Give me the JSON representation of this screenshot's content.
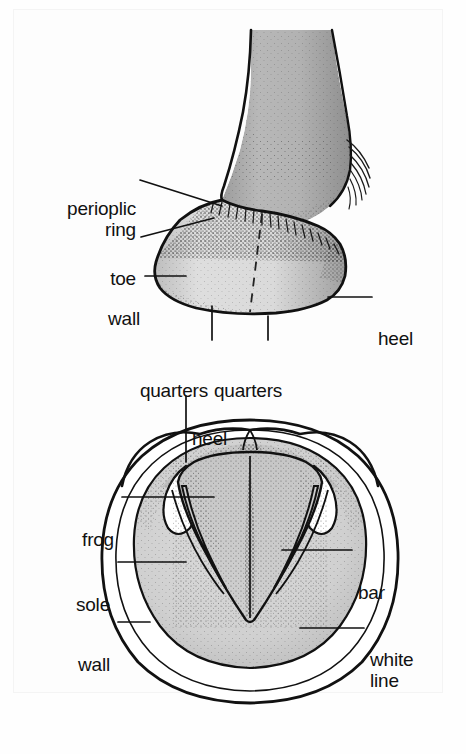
{
  "figure": {
    "background_color": "#fefefe",
    "ink_color": "#111111",
    "panels": [
      {
        "name": "lateral-view",
        "description": "Side view of lower leg, pastern and hoof showing the hoof wall"
      },
      {
        "name": "solar-view",
        "description": "Ground surface (solar) view of the hoof showing sole, frog, bars and white line"
      }
    ],
    "palette": {
      "pastern_gray": "#b2b2b2",
      "wall_gray": "#d8d8d8",
      "sole_gray": "#cfcfcf",
      "frog_gray": "#c8c8c8",
      "white": "#ffffff",
      "outline": "#111111"
    }
  },
  "labels": {
    "lateral": [
      {
        "id": "perioplic-ring",
        "text": "perioplic\nring",
        "align": "right"
      },
      {
        "id": "toe",
        "text": "toe",
        "align": "right"
      },
      {
        "id": "wall",
        "text": "wall",
        "align": "right"
      },
      {
        "id": "quarters-left",
        "text": "quarters",
        "align": "right"
      },
      {
        "id": "quarters-right",
        "text": "quarters",
        "align": "left"
      },
      {
        "id": "heel",
        "text": "heel",
        "align": "left"
      }
    ],
    "solar": [
      {
        "id": "heel",
        "text": "heel",
        "align": "left"
      },
      {
        "id": "frog",
        "text": "frog",
        "align": "right"
      },
      {
        "id": "sole",
        "text": "sole",
        "align": "right"
      },
      {
        "id": "wall",
        "text": "wall",
        "align": "right"
      },
      {
        "id": "bar",
        "text": "bar",
        "align": "left"
      },
      {
        "id": "white-line",
        "text": "white\nline",
        "align": "left"
      }
    ]
  }
}
